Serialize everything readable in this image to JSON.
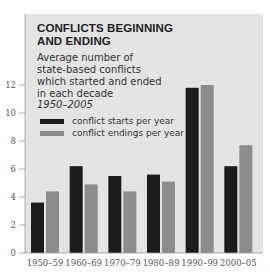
{
  "chart_data": {
    "type": "bar",
    "title_lines": [
      "CONFLICTS BEGINNING",
      "AND ENDING"
    ],
    "subtitle_lines": [
      "Average number of",
      "state-based conflicts",
      "which started and ended",
      "in each decade"
    ],
    "subtitle_period": "1950–2005",
    "xlabel": "",
    "ylabel": "",
    "categories": [
      "1950–59",
      "1960–69",
      "1970–79",
      "1980–89",
      "1990–99",
      "2000–05"
    ],
    "series": [
      {
        "name": "conflict starts per year",
        "color": "#1c1c1c",
        "values": [
          3.6,
          6.2,
          5.5,
          5.6,
          11.8,
          6.2
        ]
      },
      {
        "name": "conflict endings per year",
        "color": "#8c8c8c",
        "values": [
          4.4,
          4.9,
          4.4,
          5.1,
          12.0,
          7.7
        ]
      }
    ],
    "ylim": [
      0,
      12
    ],
    "yticks": [
      0,
      2,
      4,
      6,
      8,
      10,
      12
    ],
    "legend_position": "top-left",
    "grid": false,
    "background_color": "#e3e3e3"
  }
}
